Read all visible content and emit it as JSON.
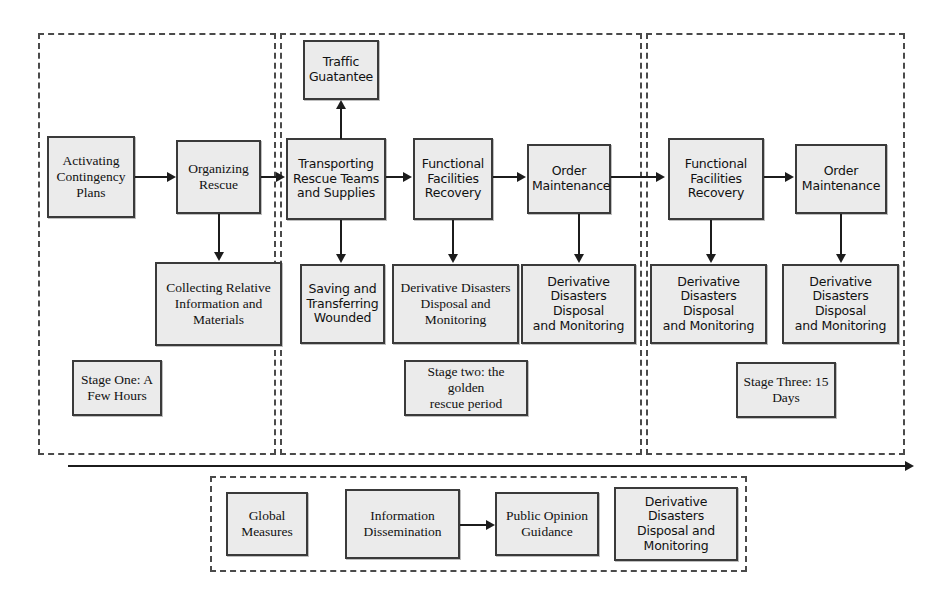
{
  "diagram": {
    "accent_color": "#ebebeb",
    "line_color": "#1c1c1c",
    "dashed_color": "#4a4a4a"
  },
  "stages": [
    {
      "id": "stage-one",
      "label": "Stage One: A\nFew Hours"
    },
    {
      "id": "stage-two",
      "label": "Stage two: the golden\nrescue period"
    },
    {
      "id": "stage-three",
      "label": "Stage Three:  15\nDays"
    }
  ],
  "nodes": {
    "activating_contingency_plans": "Activating\nContingency\nPlans",
    "organizing_rescue": "Organizing\nRescue",
    "collecting_relative_information": "Collecting Relative\nInformation and\nMaterials",
    "traffic_guarantee": "Traffic\nGuatantee",
    "transporting_rescue_teams": "Transporting\nRescue Teams\nand Supplies",
    "saving_transferring_wounded": "Saving and\nTransferring\nWounded",
    "functional_facilities_recovery_s2": "Functional\nFacilities\nRecovery",
    "derivative_disasters_s2a": "Derivative Disasters\nDisposal and\nMonitoring",
    "order_maintenance_s2": "Order\nMaintenance",
    "derivative_disasters_s2b": "Derivative\nDisasters Disposal\nand Monitoring",
    "functional_facilities_recovery_s3": "Functional\nFacilities\nRecovery",
    "derivative_disasters_s3a": "Derivative\nDisasters Disposal\nand Monitoring",
    "order_maintenance_s3": "Order\nMaintenance",
    "derivative_disasters_s3b": "Derivative\nDisasters Disposal\nand Monitoring"
  },
  "global_section": {
    "global_measures": "Global\nMeasures",
    "information_dissemination": "Information\nDissemination",
    "public_opinion_guidance": "Public Opinion\nGuidance",
    "derivative_disasters_global": "Derivative Disasters\nDisposal and\nMonitoring"
  }
}
